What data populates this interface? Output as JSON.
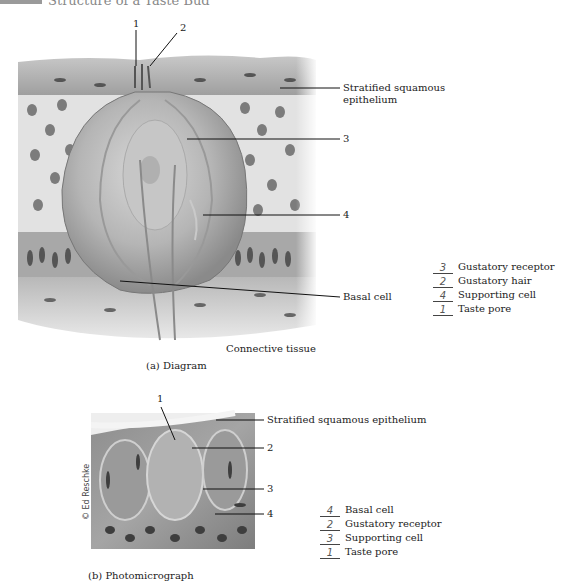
{
  "header": {
    "title": "Structure of a Taste Bud"
  },
  "diagram_a": {
    "caption": "(a) Diagram",
    "labels": {
      "n1": "1",
      "n2": "2",
      "n3": "3",
      "n4": "4",
      "stratified_line1": "Stratified squamous",
      "stratified_line2": "epithelium",
      "basal_cell": "Basal cell",
      "connective_tissue": "Connective tissue"
    },
    "key": [
      {
        "answer": "3",
        "label": "Gustatory receptor"
      },
      {
        "answer": "2",
        "label": "Gustatory hair"
      },
      {
        "answer": "4",
        "label": "Supporting cell"
      },
      {
        "answer": "1",
        "label": "Taste pore"
      }
    ]
  },
  "photo_b": {
    "caption": "(b) Photomicrograph",
    "credit": "© Ed Reschke",
    "labels": {
      "n1": "1",
      "n2": "2",
      "n3": "3",
      "n4": "4",
      "stratified": "Stratified squamous epithelium"
    },
    "key": [
      {
        "answer": "4",
        "label": "Basal cell"
      },
      {
        "answer": "2",
        "label": "Gustatory receptor"
      },
      {
        "answer": "3",
        "label": "Supporting cell"
      },
      {
        "answer": "1",
        "label": "Taste pore"
      }
    ]
  }
}
